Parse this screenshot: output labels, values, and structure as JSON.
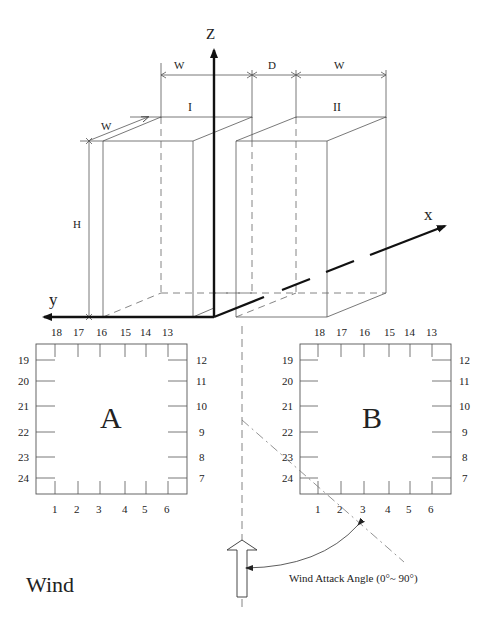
{
  "diagram": {
    "axes": {
      "z": "Z",
      "x": "x",
      "y": "y"
    },
    "dimensions": {
      "w_left": "W",
      "gap": "D",
      "w_right": "W",
      "depth": "W",
      "height": "H"
    },
    "buildings": {
      "first": "I",
      "second": "II"
    },
    "plan_a": {
      "label": "A",
      "top_taps": [
        "18",
        "17",
        "16",
        "15",
        "14",
        "13"
      ],
      "right_taps": [
        "12",
        "11",
        "10",
        "9",
        "8",
        "7"
      ],
      "bottom_taps": [
        "1",
        "2",
        "3",
        "4",
        "5",
        "6"
      ],
      "left_taps": [
        "19",
        "20",
        "21",
        "22",
        "23",
        "24"
      ]
    },
    "plan_b": {
      "label": "B",
      "top_taps": [
        "18",
        "17",
        "16",
        "15",
        "14",
        "13"
      ],
      "right_taps": [
        "12",
        "11",
        "10",
        "9",
        "8",
        "7"
      ],
      "bottom_taps": [
        "1",
        "2",
        "3",
        "4",
        "5",
        "6"
      ],
      "left_taps": [
        "19",
        "20",
        "21",
        "22",
        "23",
        "24"
      ]
    },
    "wind": {
      "label": "Wind",
      "angle_label": "Wind Attack Angle (0°~ 90°)"
    }
  }
}
